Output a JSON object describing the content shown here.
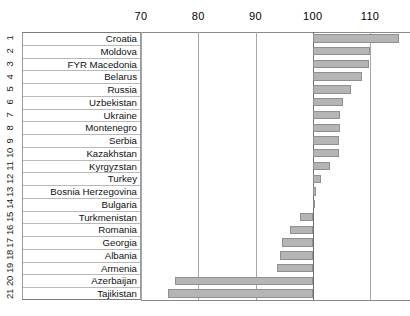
{
  "chart_data": {
    "type": "bar",
    "orientation": "horizontal",
    "title": "",
    "subtitle": "",
    "xlabel": "",
    "ylabel": "",
    "baseline": 100,
    "xlim": [
      70,
      115
    ],
    "grid": true,
    "legend": null,
    "xticks": [
      70,
      80,
      90,
      100,
      110
    ],
    "xticklabels": [
      "70",
      "80",
      "90",
      "100",
      "110"
    ],
    "ranks": [
      "1",
      "2",
      "3",
      "4",
      "5",
      "6",
      "7",
      "8",
      "9",
      "10",
      "11",
      "12",
      "13",
      "14",
      "15",
      "16",
      "17",
      "18",
      "19",
      "20",
      "21"
    ],
    "categories": [
      "Croatia",
      "Moldova",
      "FYR Macedonia",
      "Belarus",
      "Russia",
      "Uzbekistan",
      "Ukraine",
      "Montenegro",
      "Serbia",
      "Kazakhstan",
      "Kyrgyzstan",
      "Turkey",
      "Bosnia Herzegovina",
      "Bulgaria",
      "Turkmenistan",
      "Romania",
      "Georgia",
      "Albania",
      "Armenia",
      "Azerbaijan",
      "Tajikistan"
    ],
    "values": [
      115.0,
      110.0,
      109.8,
      108.6,
      106.7,
      105.3,
      104.8,
      104.7,
      104.5,
      104.5,
      103.1,
      101.4,
      100.5,
      100.2,
      97.7,
      96.0,
      94.6,
      94.2,
      93.7,
      76.0,
      74.7
    ]
  },
  "colors": {
    "bar_fill": "#b5b5b5",
    "bar_stroke": "#8f8f8f",
    "grid": "#a6a6a6",
    "baseline": "#6e6e6e",
    "text": "#111111",
    "table_border": "#b8b8b8"
  }
}
